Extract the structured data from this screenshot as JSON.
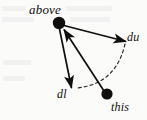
{
  "figure": {
    "kind": "vector-diagram",
    "background_color": "#fbfbfa",
    "ink_color": "#100f0d",
    "width": 147,
    "height": 120,
    "labels": {
      "above": "above",
      "du": "du",
      "dl": "dl",
      "this": "this"
    },
    "nodes": [
      {
        "id": "above",
        "label": "above",
        "x": 59,
        "y": 23,
        "radius": 6.2,
        "filled": true
      },
      {
        "id": "this",
        "label": "this",
        "x": 107,
        "y": 94,
        "radius": 5.6,
        "filled": true
      }
    ],
    "arrows": [
      {
        "id": "arrow-du",
        "from": "above",
        "to_label": "du",
        "x1": 62,
        "y1": 25,
        "x2": 127,
        "y2": 42,
        "style": "solid",
        "head_at": "end"
      },
      {
        "id": "arrow-dl",
        "from": "above",
        "to_label": "dl",
        "x1": 59,
        "y1": 29,
        "x2": 72,
        "y2": 89,
        "style": "solid",
        "head_at": "end"
      },
      {
        "id": "arrow-this-to-above",
        "from": "this",
        "to": "above",
        "x1": 104,
        "y1": 91,
        "x2": 63,
        "y2": 28,
        "style": "solid",
        "head_at": "end"
      }
    ],
    "arcs": [
      {
        "id": "arc-dashed",
        "style": "dashed",
        "dash_pattern": "3 3",
        "x1": 125,
        "y1": 44,
        "cx": 116,
        "cy": 84,
        "x2": 77,
        "y2": 88,
        "description": "dashed arc from du arrowhead curving down-left to dl arrowhead"
      }
    ]
  }
}
